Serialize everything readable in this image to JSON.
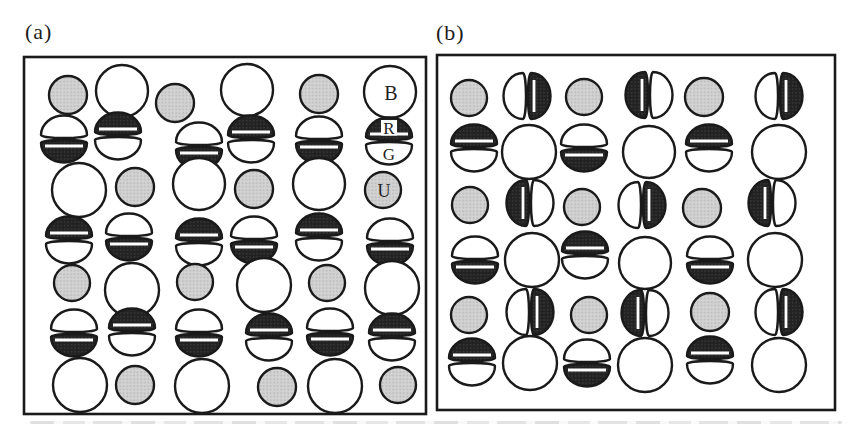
{
  "figure": {
    "colors": {
      "background": "#ffffff",
      "outline": "#1a1a1a",
      "gray_fill_base": "#d3d3d3",
      "gray_fill_dot": "#b9b9b9",
      "dark_fill_base": "#222222",
      "dark_fill_dot": "#404040",
      "label_color": "#1f1f1f",
      "stripe_color": "#ffffff"
    },
    "legend_letters": {
      "big_white_circle": "B",
      "dimer_dark_half": "R",
      "dimer_white_half": "G",
      "gray_circle": "U"
    },
    "panels": [
      {
        "id": "a",
        "label": "(a)",
        "box": {
          "x": 24,
          "y": 57,
          "w": 402,
          "h": 357
        },
        "items": [
          {
            "type": "gray",
            "x": 68,
            "y": 95,
            "r": 19
          },
          {
            "type": "big",
            "x": 122,
            "y": 91,
            "r": 26
          },
          {
            "type": "gray",
            "x": 175,
            "y": 103,
            "r": 19
          },
          {
            "type": "big",
            "x": 247,
            "y": 90,
            "r": 26
          },
          {
            "type": "gray",
            "x": 319,
            "y": 94,
            "r": 19
          },
          {
            "type": "big",
            "x": 390,
            "y": 92,
            "r": 26,
            "label": "B"
          },
          {
            "type": "dimer-h",
            "x": 64,
            "y": 139,
            "dark": "bottom"
          },
          {
            "type": "dimer-h",
            "x": 118,
            "y": 136,
            "dark": "top"
          },
          {
            "type": "dimer-h",
            "x": 199,
            "y": 146,
            "dark": "bottom"
          },
          {
            "type": "dimer-h",
            "x": 251,
            "y": 139,
            "dark": "top"
          },
          {
            "type": "dimer-h",
            "x": 319,
            "y": 140,
            "dark": "bottom"
          },
          {
            "type": "dimer-h",
            "x": 389,
            "y": 141,
            "dark": "top",
            "label_dark": "R",
            "label_light": "G"
          },
          {
            "type": "big",
            "x": 79,
            "y": 190,
            "r": 27
          },
          {
            "type": "gray",
            "x": 135,
            "y": 187,
            "r": 19
          },
          {
            "type": "big",
            "x": 199,
            "y": 184,
            "r": 26
          },
          {
            "type": "gray",
            "x": 254,
            "y": 189,
            "r": 19
          },
          {
            "type": "big",
            "x": 319,
            "y": 184,
            "r": 26
          },
          {
            "type": "gray",
            "x": 383,
            "y": 190,
            "r": 18,
            "label": "U"
          },
          {
            "type": "dimer-h",
            "x": 69,
            "y": 240,
            "dark": "top"
          },
          {
            "type": "dimer-h",
            "x": 129,
            "y": 237,
            "dark": "bottom"
          },
          {
            "type": "dimer-h",
            "x": 199,
            "y": 242,
            "dark": "top"
          },
          {
            "type": "dimer-h",
            "x": 254,
            "y": 240,
            "dark": "bottom"
          },
          {
            "type": "dimer-h",
            "x": 319,
            "y": 237,
            "dark": "top"
          },
          {
            "type": "dimer-h",
            "x": 390,
            "y": 242,
            "dark": "bottom"
          },
          {
            "type": "gray",
            "x": 72,
            "y": 283,
            "r": 18
          },
          {
            "type": "big",
            "x": 132,
            "y": 290,
            "r": 27
          },
          {
            "type": "gray",
            "x": 195,
            "y": 282,
            "r": 18
          },
          {
            "type": "big",
            "x": 264,
            "y": 285,
            "r": 27
          },
          {
            "type": "gray",
            "x": 327,
            "y": 283,
            "r": 18
          },
          {
            "type": "big",
            "x": 392,
            "y": 288,
            "r": 27
          },
          {
            "type": "dimer-h",
            "x": 74,
            "y": 333,
            "dark": "bottom"
          },
          {
            "type": "dimer-h",
            "x": 132,
            "y": 332,
            "dark": "top"
          },
          {
            "type": "dimer-h",
            "x": 199,
            "y": 333,
            "dark": "bottom"
          },
          {
            "type": "dimer-h",
            "x": 269,
            "y": 337,
            "dark": "top"
          },
          {
            "type": "dimer-h",
            "x": 330,
            "y": 332,
            "dark": "bottom"
          },
          {
            "type": "dimer-h",
            "x": 392,
            "y": 337,
            "dark": "top"
          },
          {
            "type": "big",
            "x": 80,
            "y": 385,
            "r": 27
          },
          {
            "type": "gray",
            "x": 135,
            "y": 385,
            "r": 19
          },
          {
            "type": "big",
            "x": 202,
            "y": 386,
            "r": 27
          },
          {
            "type": "gray",
            "x": 277,
            "y": 387,
            "r": 19
          },
          {
            "type": "big",
            "x": 335,
            "y": 386,
            "r": 27
          },
          {
            "type": "gray",
            "x": 398,
            "y": 385,
            "r": 18
          }
        ]
      },
      {
        "id": "b",
        "label": "(b)",
        "box": {
          "x": 437,
          "y": 55,
          "w": 398,
          "h": 355
        },
        "items": [
          {
            "type": "gray",
            "x": 469,
            "y": 98,
            "r": 18
          },
          {
            "type": "dimer-v",
            "x": 527,
            "y": 96,
            "dark": "right"
          },
          {
            "type": "gray",
            "x": 584,
            "y": 97,
            "r": 18
          },
          {
            "type": "dimer-v",
            "x": 649,
            "y": 95,
            "dark": "left"
          },
          {
            "type": "gray",
            "x": 704,
            "y": 97,
            "r": 19
          },
          {
            "type": "dimer-v",
            "x": 779,
            "y": 96,
            "dark": "right"
          },
          {
            "type": "dimer-h",
            "x": 474,
            "y": 148,
            "dark": "top"
          },
          {
            "type": "big",
            "x": 529,
            "y": 152,
            "r": 27
          },
          {
            "type": "dimer-h",
            "x": 584,
            "y": 148,
            "dark": "bottom"
          },
          {
            "type": "big",
            "x": 649,
            "y": 152,
            "r": 26
          },
          {
            "type": "dimer-h",
            "x": 709,
            "y": 148,
            "dark": "top"
          },
          {
            "type": "big",
            "x": 779,
            "y": 152,
            "r": 27
          },
          {
            "type": "gray",
            "x": 470,
            "y": 205,
            "r": 18
          },
          {
            "type": "dimer-v",
            "x": 530,
            "y": 203,
            "dark": "left"
          },
          {
            "type": "gray",
            "x": 582,
            "y": 207,
            "r": 18
          },
          {
            "type": "dimer-v",
            "x": 642,
            "y": 205,
            "dark": "right"
          },
          {
            "type": "gray",
            "x": 702,
            "y": 208,
            "r": 19
          },
          {
            "type": "dimer-v",
            "x": 772,
            "y": 203,
            "dark": "left"
          },
          {
            "type": "dimer-h",
            "x": 475,
            "y": 260,
            "dark": "bottom"
          },
          {
            "type": "big",
            "x": 532,
            "y": 260,
            "r": 27
          },
          {
            "type": "dimer-h",
            "x": 585,
            "y": 255,
            "dark": "top"
          },
          {
            "type": "big",
            "x": 645,
            "y": 263,
            "r": 26
          },
          {
            "type": "dimer-h",
            "x": 710,
            "y": 260,
            "dark": "bottom"
          },
          {
            "type": "big",
            "x": 775,
            "y": 260,
            "r": 27
          },
          {
            "type": "gray",
            "x": 469,
            "y": 315,
            "r": 18
          },
          {
            "type": "dimer-v",
            "x": 530,
            "y": 312,
            "dark": "right"
          },
          {
            "type": "gray",
            "x": 589,
            "y": 315,
            "r": 18
          },
          {
            "type": "dimer-v",
            "x": 645,
            "y": 313,
            "dark": "left"
          },
          {
            "type": "gray",
            "x": 710,
            "y": 312,
            "r": 19
          },
          {
            "type": "dimer-v",
            "x": 779,
            "y": 312,
            "dark": "right"
          },
          {
            "type": "dimer-h",
            "x": 472,
            "y": 362,
            "dark": "top"
          },
          {
            "type": "big",
            "x": 530,
            "y": 363,
            "r": 27
          },
          {
            "type": "dimer-h",
            "x": 587,
            "y": 363,
            "dark": "bottom"
          },
          {
            "type": "big",
            "x": 645,
            "y": 365,
            "r": 27
          },
          {
            "type": "dimer-h",
            "x": 710,
            "y": 360,
            "dark": "top"
          },
          {
            "type": "big",
            "x": 779,
            "y": 365,
            "r": 27
          }
        ]
      }
    ]
  }
}
